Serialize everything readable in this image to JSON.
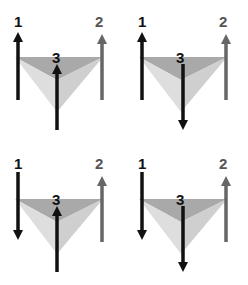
{
  "diagram": {
    "colors": {
      "arrow_dark": "#111111",
      "arrow_gray": "#666666",
      "tri_top": "#a9a9a9",
      "tri_left": "#dedede",
      "tri_right": "#cfcfcf"
    },
    "panels": [
      {
        "id": "top-left",
        "spins": {
          "1": "up",
          "2": "up",
          "3": "up"
        },
        "labels": [
          "1",
          "2",
          "3"
        ]
      },
      {
        "id": "top-right",
        "spins": {
          "1": "up",
          "2": "up",
          "3": "down"
        },
        "labels": [
          "1",
          "2",
          "3"
        ]
      },
      {
        "id": "bottom-left",
        "spins": {
          "1": "down",
          "2": "up",
          "3": "up"
        },
        "labels": [
          "1",
          "2",
          "3"
        ]
      },
      {
        "id": "bottom-right",
        "spins": {
          "1": "down",
          "2": "up",
          "3": "down"
        },
        "labels": [
          "1",
          "2",
          "3"
        ]
      }
    ]
  }
}
